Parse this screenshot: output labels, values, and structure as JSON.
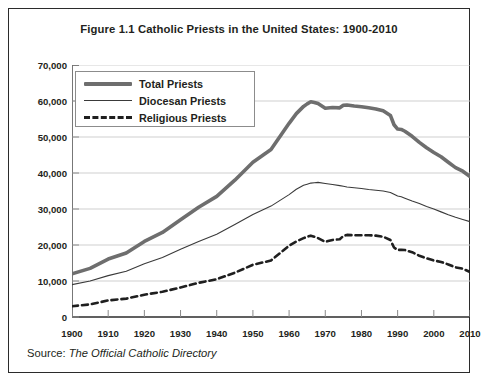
{
  "figure": {
    "title": "Figure 1.1 Catholic Priests in the United States: 1900-2010",
    "source_label": "Source:",
    "source_title": "The Official Catholic Directory"
  },
  "legend": {
    "position": "top-left-inside",
    "items": [
      {
        "label": "Total Priests",
        "style": "thick-solid",
        "color": "#6e6e6e",
        "icon": "line-thick-icon"
      },
      {
        "label": "Diocesan Priests",
        "style": "thin-solid",
        "color": "#3a3a3a",
        "icon": "line-thin-icon"
      },
      {
        "label": "Religious Priests",
        "style": "dashed",
        "color": "#1f1f1f",
        "icon": "line-dashed-icon"
      }
    ]
  },
  "axes": {
    "y_ticks": [
      "70,000",
      "60,000",
      "50,000",
      "40,000",
      "30,000",
      "20,000",
      "10,000",
      "0"
    ],
    "x_ticks": [
      "1900",
      "1910",
      "1920",
      "1930",
      "1940",
      "1950",
      "1960",
      "1970",
      "1980",
      "1990",
      "2000",
      "2010"
    ]
  },
  "chart_data": {
    "type": "line",
    "title": "Figure 1.1 Catholic Priests in the United States: 1900-2010",
    "xlabel": "",
    "ylabel": "",
    "xlim": [
      1900,
      2010
    ],
    "ylim": [
      0,
      70000
    ],
    "ytick_interval": 10000,
    "xtick_interval": 10,
    "grid": "horizontal",
    "legend_position": "upper left (inside plot)",
    "source": "The Official Catholic Directory",
    "x": [
      1900,
      1905,
      1910,
      1915,
      1920,
      1925,
      1930,
      1935,
      1940,
      1945,
      1950,
      1955,
      1960,
      1962,
      1964,
      1965,
      1966,
      1967,
      1968,
      1970,
      1972,
      1974,
      1975,
      1976,
      1978,
      1980,
      1982,
      1984,
      1986,
      1988,
      1989,
      1990,
      1991,
      1992,
      1994,
      1996,
      1998,
      2000,
      2002,
      2004,
      2006,
      2008,
      2010
    ],
    "series": [
      {
        "name": "Total Priests",
        "style": "thick-solid",
        "color": "#6e6e6e",
        "values": [
          11987,
          13500,
          16100,
          17800,
          21000,
          23500,
          27000,
          30500,
          33500,
          38000,
          43000,
          46500,
          53800,
          56500,
          58500,
          59200,
          59800,
          59600,
          59300,
          58000,
          58200,
          58100,
          58800,
          58900,
          58600,
          58400,
          58100,
          57800,
          57300,
          56000,
          53400,
          52200,
          52100,
          51600,
          50200,
          48500,
          47000,
          45700,
          44500,
          43000,
          41500,
          40500,
          39000
        ]
      },
      {
        "name": "Diocesan Priests",
        "style": "thin-solid",
        "color": "#3a3a3a",
        "values": [
          9000,
          10000,
          11500,
          12700,
          14800,
          16500,
          18800,
          21000,
          23000,
          25700,
          28500,
          30800,
          34000,
          35500,
          36600,
          36900,
          37200,
          37300,
          37400,
          37100,
          36800,
          36500,
          36300,
          36100,
          35900,
          35700,
          35400,
          35200,
          35000,
          34600,
          34100,
          33600,
          33400,
          33000,
          32200,
          31500,
          30700,
          30000,
          29200,
          28400,
          27700,
          27100,
          26500
        ]
      },
      {
        "name": "Religious Priests",
        "style": "dashed",
        "color": "#1f1f1f",
        "values": [
          2987,
          3500,
          4600,
          5100,
          6200,
          7000,
          8200,
          9500,
          10500,
          12300,
          14500,
          15700,
          19800,
          21000,
          21900,
          22300,
          22600,
          22300,
          21900,
          20900,
          21400,
          21600,
          22500,
          22800,
          22700,
          22700,
          22700,
          22600,
          22300,
          21400,
          19300,
          18600,
          18700,
          18600,
          18000,
          17000,
          16300,
          15700,
          15300,
          14600,
          13800,
          13400,
          12500
        ]
      }
    ]
  }
}
